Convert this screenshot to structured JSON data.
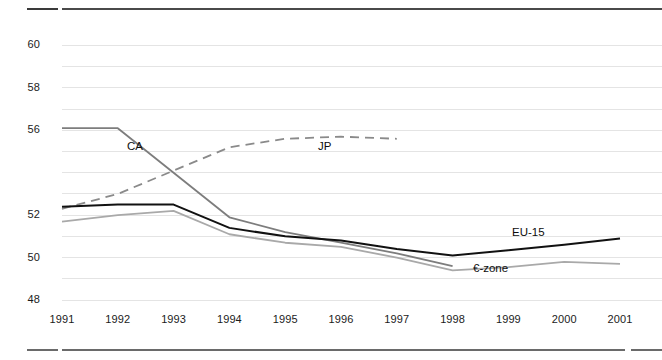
{
  "chart_data": {
    "type": "line",
    "title": "",
    "subtitle": "",
    "xlabel": "",
    "ylabel": "",
    "x": [
      1991,
      1992,
      1993,
      1994,
      1995,
      1996,
      1997,
      1998,
      1999,
      2000,
      2001
    ],
    "xtick_labels": [
      "1991",
      "1992",
      "1993",
      "1994",
      "1995",
      "1996",
      "1997",
      "1998",
      "1999",
      "2000",
      "2001"
    ],
    "ytick_labels": [
      "48",
      "50",
      "52",
      "54",
      "56",
      "58",
      "60"
    ],
    "ytick_labels_visible": [
      "48",
      "50",
      "52",
      "56",
      "58",
      "60"
    ],
    "yticks": [
      48,
      50,
      52,
      54,
      56,
      58,
      60
    ],
    "ylim": [
      48,
      61.2
    ],
    "xlim": [
      1991,
      2001
    ],
    "grid": "horizontal",
    "gridline_interval": 1,
    "legend_position": "inline-annotations",
    "series": [
      {
        "name": "CA",
        "label": "CA",
        "style": "solid",
        "color": "#7d7d7d",
        "width": 1.8,
        "x": [
          1991,
          1992,
          1993,
          1994,
          1995,
          1996,
          1997,
          1998
        ],
        "values": [
          56.1,
          56.1,
          54.0,
          51.9,
          51.2,
          50.7,
          50.2,
          49.6
        ]
      },
      {
        "name": "JP",
        "label": "JP",
        "style": "dashed",
        "color": "#8a8a8a",
        "width": 1.8,
        "x": [
          1991,
          1992,
          1993,
          1994,
          1995,
          1996,
          1997
        ],
        "values": [
          52.3,
          53.0,
          54.1,
          55.2,
          55.6,
          55.7,
          55.6
        ]
      },
      {
        "name": "EU-15",
        "label": "EU-15",
        "style": "solid",
        "color": "#111111",
        "width": 2.0,
        "x": [
          1991,
          1992,
          1993,
          1994,
          1995,
          1996,
          1997,
          1998,
          1999,
          2000,
          2001
        ],
        "values": [
          52.4,
          52.5,
          52.5,
          51.4,
          51.0,
          50.8,
          50.4,
          50.1,
          50.35,
          50.6,
          50.9
        ]
      },
      {
        "name": "€-zone",
        "label": "€-zone",
        "style": "solid",
        "color": "#a9a9a9",
        "width": 1.8,
        "x": [
          1991,
          1992,
          1993,
          1994,
          1995,
          1996,
          1997,
          1998,
          1999,
          2000,
          2001
        ],
        "values": [
          51.7,
          52.0,
          52.2,
          51.1,
          50.7,
          50.5,
          50.0,
          49.4,
          49.55,
          49.8,
          49.7
        ]
      }
    ],
    "annotations": [
      {
        "text": "CA",
        "series": "CA",
        "x_px": 127,
        "y_px": 140
      },
      {
        "text": "JP",
        "series": "JP",
        "x_px": 318,
        "y_px": 140
      },
      {
        "text": "EU-15",
        "series": "EU-15",
        "x_px": 512,
        "y_px": 226
      },
      {
        "text": "€-zone",
        "series": "€-zone",
        "x_px": 473,
        "y_px": 262
      }
    ],
    "colors": {
      "ca": "#7d7d7d",
      "jp": "#8a8a8a",
      "eu15": "#111111",
      "ezone": "#a9a9a9",
      "gridline": "#e4e4e4",
      "axis_text": "#1b1b1b",
      "rule": "#5a5a5a",
      "background": "#ffffff"
    }
  }
}
